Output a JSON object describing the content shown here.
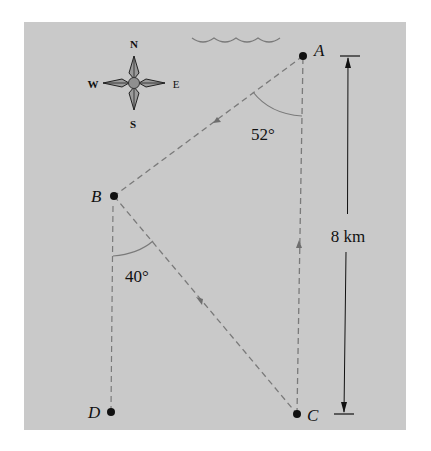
{
  "figure": {
    "background_color": "#c9c9c9",
    "line_color": "#7a7a7a",
    "ink_color": "#111111"
  },
  "compass": {
    "north": "N",
    "south": "S",
    "east": "E",
    "west": "W"
  },
  "points": {
    "A": "A",
    "B": "B",
    "C": "C",
    "D": "D"
  },
  "angles": {
    "at_A": "52°",
    "at_B": "40°"
  },
  "dimension": {
    "label": "8 km"
  }
}
